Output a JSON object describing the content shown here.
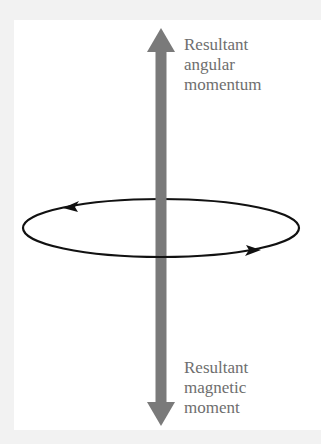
{
  "diagram": {
    "top_label": [
      "Resultant",
      "angular",
      "momentum"
    ],
    "bottom_label": [
      "Resultant",
      "magnetic",
      "moment"
    ],
    "colors": {
      "axis_arrow": "#7a7a7a",
      "loop": "#111111",
      "label_text": "#6e6e6e",
      "background": "#ffffff",
      "border": "#f2f2f2"
    }
  }
}
